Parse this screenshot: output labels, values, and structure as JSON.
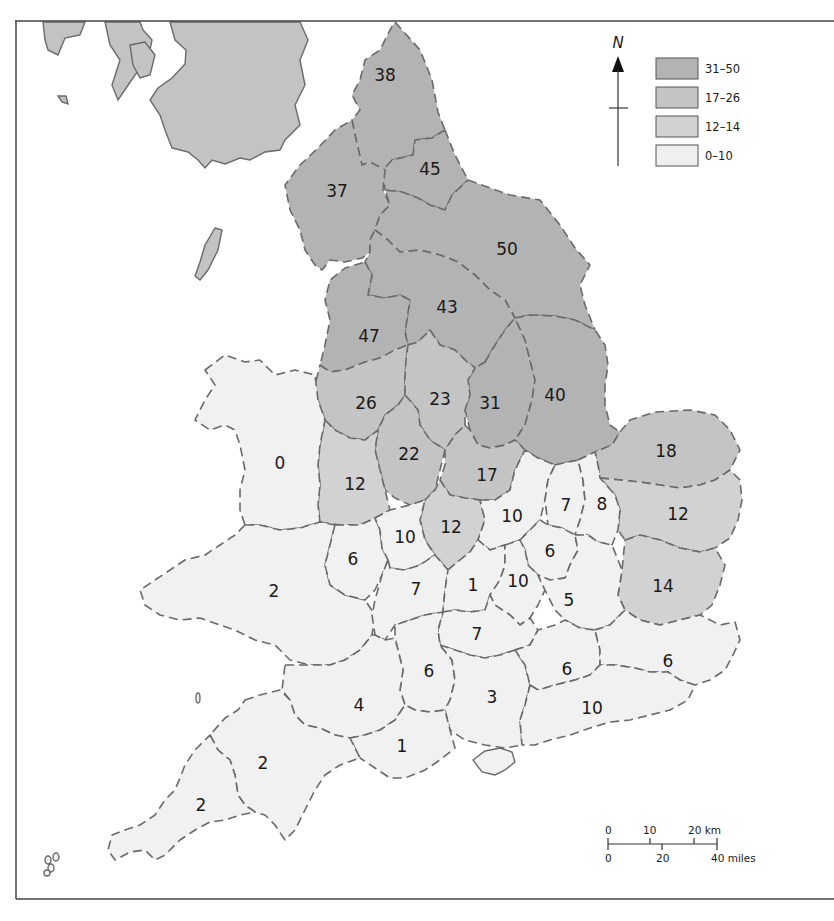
{
  "map": {
    "north_label": "N",
    "colors": {
      "31-50": "#b3b3b3",
      "17-26": "#c4c4c4",
      "12-14": "#d2d2d2",
      "0-10": "#f1f1f1",
      "foreign_land": "#c3c3c3",
      "sea": "#ffffff",
      "border": "#6a6a6a"
    },
    "legend": [
      {
        "label": "31–50",
        "class": "31-50",
        "color": "#b3b3b3"
      },
      {
        "label": "17–26",
        "class": "17-26",
        "color": "#c4c4c4"
      },
      {
        "label": "12–14",
        "class": "12-14",
        "color": "#d2d2d2"
      },
      {
        "label": "0–10",
        "class": "0-10",
        "color": "#efefef"
      }
    ],
    "scale_bar": {
      "km_ticks": [
        "0",
        "10",
        "20 km"
      ],
      "mile_ticks": [
        "0",
        "20",
        "40 miles"
      ]
    },
    "regions": [
      {
        "id": "r38",
        "value": "38"
      },
      {
        "id": "r45",
        "value": "45"
      },
      {
        "id": "r37",
        "value": "37"
      },
      {
        "id": "r50",
        "value": "50"
      },
      {
        "id": "r43",
        "value": "43"
      },
      {
        "id": "r47",
        "value": "47"
      },
      {
        "id": "r26",
        "value": "26"
      },
      {
        "id": "r23",
        "value": "23"
      },
      {
        "id": "r31",
        "value": "31"
      },
      {
        "id": "r40",
        "value": "40"
      },
      {
        "id": "r18",
        "value": "18"
      },
      {
        "id": "r0",
        "value": "0"
      },
      {
        "id": "r12a",
        "value": "12"
      },
      {
        "id": "r22",
        "value": "22"
      },
      {
        "id": "r17",
        "value": "17"
      },
      {
        "id": "r12b",
        "value": "12"
      },
      {
        "id": "r10a",
        "value": "10"
      },
      {
        "id": "r7a",
        "value": "7"
      },
      {
        "id": "r8",
        "value": "8"
      },
      {
        "id": "r12c",
        "value": "12"
      },
      {
        "id": "r10b",
        "value": "10"
      },
      {
        "id": "r6a",
        "value": "6"
      },
      {
        "id": "r6b",
        "value": "6"
      },
      {
        "id": "r2a",
        "value": "2"
      },
      {
        "id": "r7b",
        "value": "7"
      },
      {
        "id": "r1a",
        "value": "1"
      },
      {
        "id": "r10c",
        "value": "10"
      },
      {
        "id": "r5",
        "value": "5"
      },
      {
        "id": "r14",
        "value": "14"
      },
      {
        "id": "r7c",
        "value": "7"
      },
      {
        "id": "r6c",
        "value": "6"
      },
      {
        "id": "r3",
        "value": "3"
      },
      {
        "id": "r6d",
        "value": "6"
      },
      {
        "id": "r6e",
        "value": "6"
      },
      {
        "id": "r4",
        "value": "4"
      },
      {
        "id": "r10d",
        "value": "10"
      },
      {
        "id": "r1b",
        "value": "1"
      },
      {
        "id": "r2b",
        "value": "2"
      },
      {
        "id": "r2c",
        "value": "2"
      }
    ]
  }
}
